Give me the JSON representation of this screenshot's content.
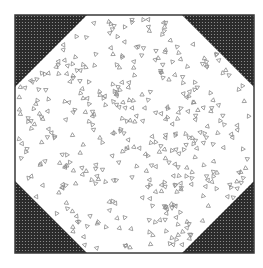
{
  "figure": {
    "square": {
      "x": 15,
      "y": 15,
      "width": 239,
      "height": 238
    },
    "corner_leg": 72,
    "colors": {
      "background": "#ffffff",
      "border": "#3a3a3a",
      "corner_fill": "#2b2b2b",
      "corner_dot": "#9a9a9a",
      "glyph": "#8a8a8a"
    },
    "corners": [
      "top-left",
      "top-right",
      "bottom-left",
      "bottom-right"
    ],
    "glyph_shape": "small-triangle",
    "glyph_count": 420,
    "glyph_size": 4
  }
}
